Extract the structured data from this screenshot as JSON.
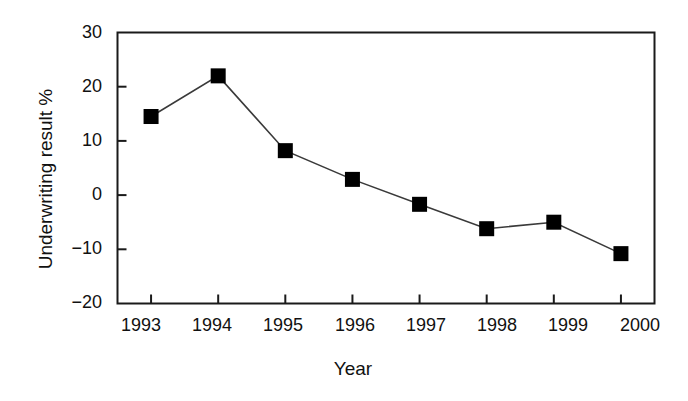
{
  "chart_data": {
    "type": "line",
    "title": "",
    "xlabel": "Year",
    "ylabel": "Underwriting result %",
    "categories": [
      "1993",
      "1994",
      "1995",
      "1996",
      "1997",
      "1998",
      "1999",
      "2000"
    ],
    "x": [
      1993,
      1994,
      1995,
      1996,
      1997,
      1998,
      1999,
      2000
    ],
    "values": [
      14.5,
      22.0,
      8.2,
      2.9,
      -1.7,
      -6.2,
      -5.0,
      -10.8
    ],
    "series": [
      {
        "name": "Underwriting result %",
        "values": [
          14.5,
          22.0,
          8.2,
          2.9,
          -1.7,
          -6.2,
          -5.0,
          -10.8
        ]
      }
    ],
    "ylim": [
      -20,
      30
    ],
    "yticks": [
      30,
      20,
      10,
      0,
      -10,
      -20
    ],
    "ytick_labels": [
      "30",
      "20",
      "10",
      "0",
      "−10",
      "−20"
    ],
    "xtick_labels": [
      "1993",
      "1994",
      "1995",
      "1996",
      "1997",
      "1998",
      "1999",
      "2000"
    ],
    "grid": false,
    "legend": "none",
    "marker": "square",
    "marker_color": "#000000",
    "line_color": "#3a3a3a",
    "axis_color": "#1a1a1a",
    "background": "#ffffff"
  }
}
